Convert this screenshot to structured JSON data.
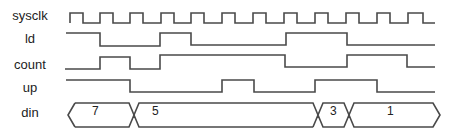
{
  "diagram": {
    "type": "timing-diagram",
    "signals": [
      {
        "name": "sysclk",
        "kind": "clock",
        "label_y": 8
      },
      {
        "name": "ld",
        "kind": "digital",
        "label_y": 31
      },
      {
        "name": "count",
        "kind": "digital",
        "label_y": 57
      },
      {
        "name": "up",
        "kind": "digital",
        "label_y": 80
      },
      {
        "name": "din",
        "kind": "bus",
        "label_y": 105
      }
    ],
    "din_values": [
      "7",
      "5",
      "3",
      "1"
    ],
    "waveforms": {
      "sysclk": "M70,23 L70,13 L83,13 L83,23 L100,23 L100,13 L113,13 L113,23 L130,23 L130,13 L143,13 L143,23 L161,23 L161,13 L174,13 L174,23 L191,23 L191,13 L204,13 L204,23 L222,23 L222,13 L235,13 L235,23 L253,23 L253,13 L266,13 L266,23 L284,23 L284,13 L297,13 L297,23 L315,23 L315,13 L328,13 L328,23 L346,23 L346,13 L359,13 L359,23 L377,23 L377,13 L390,13 L390,23 L408,23 L408,13 L423,13 L423,23 L435,23",
      "ld": "M66,33 L100,33 L100,46 L160,46 L160,33 L191,33 L191,45 L286,45 L286,33 L347,33 L347,45 L435,45",
      "count": "M65,69 L100,69 L100,57 L130,57 L130,69 L160,69 L160,55 L285,55 L285,67 L347,67 L347,55 L407,55 L407,67 L435,67",
      "up": "M66,80 L130,80 L130,92 L222,92 L222,80 L254,80 L254,92 L315,92 L315,80 L377,80 L377,92 L435,92",
      "din": "M75,103 L129,103 L139,127 L313,127 M75,127 L129,127 L139,103 L313,103 L323,127 L344,127 L354,103 L433,103 L440,115 L433,127 L354,127 L344,103 L323,103 L313,127 M75,103 L68,115 L75,127"
    },
    "din_label_x": [
      91,
      152,
      327,
      390
    ]
  }
}
